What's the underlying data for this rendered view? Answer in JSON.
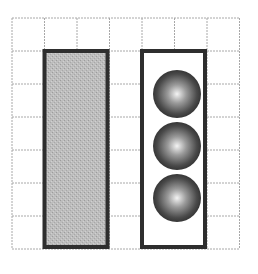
{
  "figure": {
    "grid": {
      "cols": 7,
      "rows": 7,
      "x0": 12,
      "y0": 18,
      "cell_w": 32.5,
      "cell_h": 33,
      "line_color": "#a8a8a8"
    },
    "left_container": {
      "label": "shaded-block",
      "col_start": 1,
      "col_end": 3,
      "row_start": 1,
      "row_end": 7,
      "fill": "#bdbdbd",
      "stroke": "#2e2e2e"
    },
    "right_container": {
      "label": "ball-container",
      "col_start": 4,
      "col_end": 6,
      "row_start": 1,
      "row_end": 7,
      "fill": "#ffffff",
      "stroke": "#2e2e2e"
    },
    "balls": [
      {
        "cx": 177,
        "cy": 94,
        "r": 24
      },
      {
        "cx": 177,
        "cy": 146,
        "r": 24
      },
      {
        "cx": 177,
        "cy": 198,
        "r": 24
      }
    ]
  }
}
